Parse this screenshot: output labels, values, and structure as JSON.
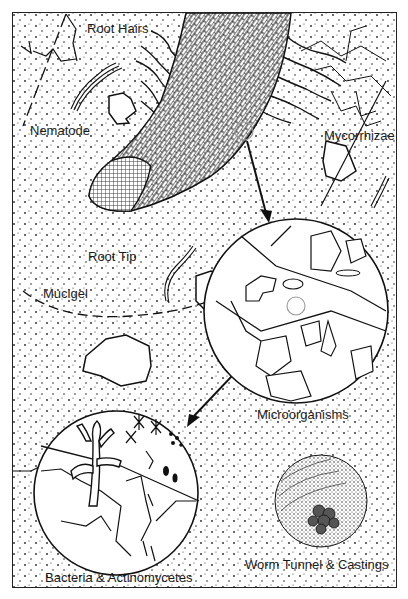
{
  "diagram": {
    "labels": {
      "root_hairs": "Root Hairs",
      "nematode": "Nematode",
      "mycorrhizae": "Mycorrhizae",
      "root_tip": "Root Tip",
      "mucigel": "Mucigel",
      "microorganisms": "Microorganisms",
      "bacteria": "Bacteria & Actinomycetes",
      "worm": "Worm Tunnel & Castings"
    },
    "colors": {
      "ink": "#1a1a1a",
      "background": "#ffffff",
      "highlight_circle": "#999999"
    }
  }
}
